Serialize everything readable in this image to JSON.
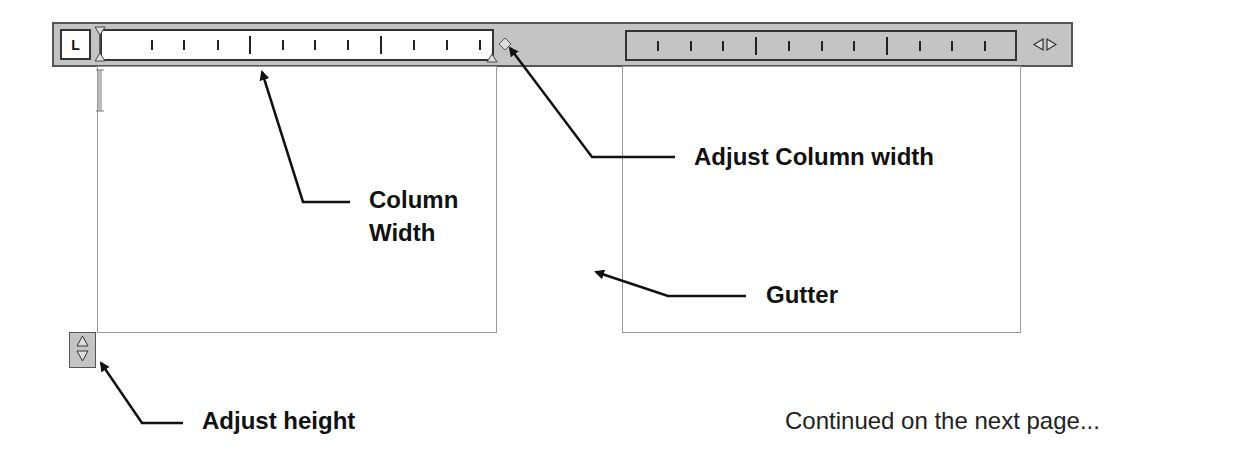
{
  "ruler": {
    "tab_stop_label": "L",
    "column_ruler_ticks": [
      "minor",
      "minor",
      "minor",
      "major",
      "minor",
      "minor",
      "minor",
      "major",
      "minor",
      "minor",
      "minor"
    ],
    "second_ruler_ticks": [
      "minor",
      "minor",
      "minor",
      "major",
      "minor",
      "minor",
      "minor",
      "major",
      "minor",
      "minor",
      "minor"
    ],
    "scroll_icon": "left-right-arrows-icon",
    "column_width_handle_icon": "diamond-handle-icon",
    "margin_marker_icon": "triangle-marker-icon"
  },
  "columns": [
    {
      "name": "column-1"
    },
    {
      "name": "column-2"
    }
  ],
  "height_control": {
    "icon": "up-down-arrows-icon"
  },
  "annotations": {
    "column_width": [
      "Column",
      "Width"
    ],
    "adjust_column_width": "Adjust Column width",
    "gutter": "Gutter",
    "adjust_height": "Adjust height"
  },
  "footer": {
    "continued": "Continued on the next page..."
  },
  "colors": {
    "ruler_bg": "#c4c4c4",
    "border": "#333333",
    "column_border": "#9a9a9a",
    "text": "#111111"
  }
}
